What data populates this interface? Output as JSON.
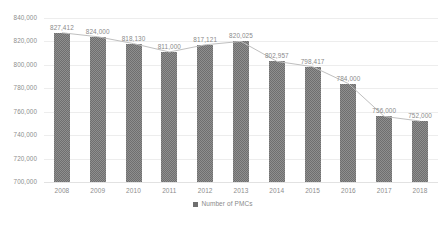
{
  "chart_data": {
    "type": "bar",
    "title": "",
    "xlabel": "",
    "ylabel": "",
    "categories": [
      "2008",
      "2009",
      "2010",
      "2011",
      "2012",
      "2013",
      "2014",
      "2015",
      "2016",
      "2017",
      "2018"
    ],
    "values": [
      827412,
      824000,
      818130,
      811000,
      817121,
      820025,
      802957,
      798417,
      784000,
      756000,
      752000
    ],
    "data_labels": [
      "827,412",
      "824,000",
      "818,130",
      "811,000",
      "817,121",
      "820,025",
      "802,957",
      "798,417",
      "784,000",
      "756,000",
      "752,000"
    ],
    "series": [
      {
        "name": "Number of PMCs",
        "values": [
          827412,
          824000,
          818130,
          811000,
          817121,
          820025,
          802957,
          798417,
          784000,
          756000,
          752000
        ]
      }
    ],
    "ylim": [
      700000,
      840000
    ],
    "ytick_step": 20000,
    "ytick_labels": [
      "840,000",
      "820,000",
      "800,000",
      "780,000",
      "760,000",
      "740,000",
      "720,000",
      "700,000"
    ],
    "ytick_values": [
      840000,
      820000,
      800000,
      780000,
      760000,
      740000,
      720000,
      700000
    ],
    "grid": true,
    "legend": {
      "position": "bottom-center",
      "entries": [
        {
          "label": "Number of PMCs",
          "color": "#6f6f6f"
        }
      ]
    },
    "has_line_overlay": true,
    "colors": {
      "bar": "#6f6f6f",
      "line": "#bfbfbf",
      "grid": "#ededed",
      "text": "#8a8a8a",
      "background": "#ffffff"
    }
  }
}
